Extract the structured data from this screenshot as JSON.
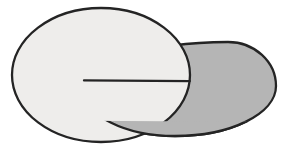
{
  "figure": {
    "background": "#ffffff",
    "stroke_color": "#242424",
    "stroke_width": "2.3",
    "disc": {
      "fill": "#eeedeb",
      "cx": "101",
      "cy": "75",
      "rx": "89",
      "ry": "67"
    },
    "ellipse": {
      "fill": "#b5b5b5",
      "path": "M 84 90 C 84 115.4 124.7 136 175 136 C 230.8 136 276 113.6 276 86 C 276 61.7 254.5 42 228 42 C 148.5 42 84 63.5 84 90 Z"
    },
    "notch": {
      "clip_style": "clip-path: polygon(0px 79.9px, 289px 81.6px, 289px 148px, 0px 148px)",
      "chord": {
        "x1": "84",
        "y1": "80.4",
        "x2": "189.8",
        "y2": "81.05"
      }
    }
  }
}
